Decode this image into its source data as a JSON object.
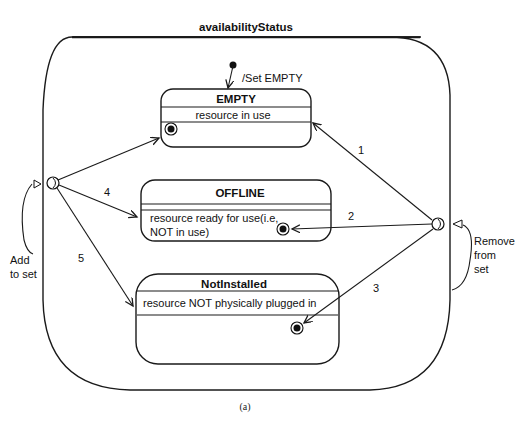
{
  "diagram": {
    "superstate": {
      "title": "availabilityStatus"
    },
    "initial": {
      "label": "/Set EMPTY"
    },
    "states": [
      {
        "name": "EMPTY",
        "description": "resource in use"
      },
      {
        "name": "OFFLINE",
        "description_line1": "resource ready for use(i.e,",
        "description_line2": "NOT in use)"
      },
      {
        "name": "NotInstalled",
        "description": "resource NOT physically plugged in"
      }
    ],
    "transitions": [
      {
        "label": "1"
      },
      {
        "label": "2"
      },
      {
        "label": "3"
      },
      {
        "label": "4"
      },
      {
        "label": "5"
      }
    ],
    "entry": {
      "label_line1": "Add",
      "label_line2": "to set"
    },
    "exit": {
      "label_line1": "Remove",
      "label_line2": "from",
      "label_line3": "set"
    },
    "caption": "(a)",
    "colors": {
      "stroke": "#1a1a1a",
      "background": "#ffffff"
    }
  }
}
